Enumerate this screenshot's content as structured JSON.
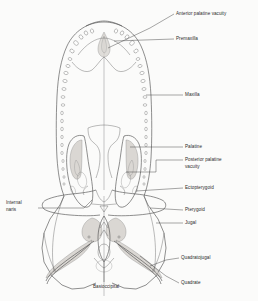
{
  "figure": {
    "background_color": "#fbfbfa",
    "line_color": "#4a4a4a",
    "shade_color": "#cfcbc6",
    "text_color": "#2b2b2b",
    "view": "palatal view"
  },
  "labels": [
    {
      "id": "anterior-palatine-vacuity",
      "text": "Anterior palatine vacuity",
      "lines": [
        "Anterior palatine vacuity"
      ],
      "x": 176,
      "y": 15,
      "anchor": "start",
      "side": "right"
    },
    {
      "id": "premaxilla",
      "text": "Premaxilla",
      "lines": [
        "Premaxilla"
      ],
      "x": 176,
      "y": 40,
      "anchor": "start",
      "side": "right"
    },
    {
      "id": "maxilla",
      "text": "Maxilla",
      "lines": [
        "Maxilla"
      ],
      "x": 185,
      "y": 96,
      "anchor": "start",
      "side": "right"
    },
    {
      "id": "palatine",
      "text": "Palatine",
      "lines": [
        "Palatine"
      ],
      "x": 185,
      "y": 148,
      "anchor": "start",
      "side": "right"
    },
    {
      "id": "posterior-palatine-vacuity",
      "text": "Posterior palatine vacuity",
      "lines": [
        "Posterior palatine",
        "vacuity"
      ],
      "x": 185,
      "y": 161,
      "anchor": "start",
      "side": "right"
    },
    {
      "id": "ectopterygoid",
      "text": "Ectopterygoid",
      "lines": [
        "Ectopterygoid"
      ],
      "x": 185,
      "y": 189,
      "anchor": "start",
      "side": "right"
    },
    {
      "id": "pterygoid",
      "text": "Pterygoid",
      "lines": [
        "Pterygoid"
      ],
      "x": 185,
      "y": 211,
      "anchor": "start",
      "side": "right"
    },
    {
      "id": "jugal",
      "text": "Jugal",
      "lines": [
        "Jugal"
      ],
      "x": 185,
      "y": 224,
      "anchor": "start",
      "side": "right"
    },
    {
      "id": "quadratojugal",
      "text": "Quadratojugal",
      "lines": [
        "Quadratojugal"
      ],
      "x": 181,
      "y": 259,
      "anchor": "start",
      "side": "right"
    },
    {
      "id": "quadrate",
      "text": "Quadrate",
      "lines": [
        "Quadrate"
      ],
      "x": 181,
      "y": 284,
      "anchor": "start",
      "side": "right"
    },
    {
      "id": "internal-naris",
      "text": "Internal naris",
      "lines": [
        "Internal",
        "naris"
      ],
      "x": 6,
      "y": 204,
      "anchor": "start",
      "side": "left"
    },
    {
      "id": "basioccipital",
      "text": "Basioccipital",
      "lines": [
        "Basioccipital"
      ],
      "x": 106,
      "y": 288,
      "anchor": "middle",
      "side": "bottom"
    }
  ]
}
